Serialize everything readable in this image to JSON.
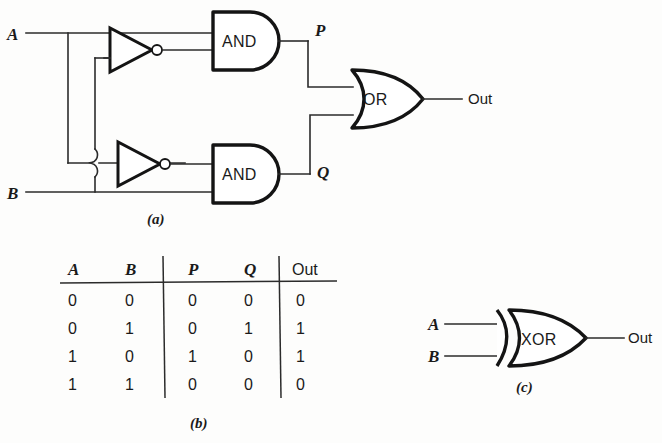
{
  "figure": {
    "captions": {
      "a": "(a)",
      "b": "(b)",
      "c": "(c)"
    }
  },
  "circuit": {
    "inputs": [
      {
        "name": "input-a",
        "label": "A"
      },
      {
        "name": "input-b",
        "label": "B"
      }
    ],
    "gates": [
      {
        "name": "inverter-top",
        "label": "",
        "type": "NOT"
      },
      {
        "name": "inverter-bottom",
        "label": "",
        "type": "NOT"
      },
      {
        "name": "and-gate-top",
        "label": "AND",
        "type": "AND"
      },
      {
        "name": "and-gate-bottom",
        "label": "AND",
        "type": "AND"
      },
      {
        "name": "or-gate",
        "label": "OR",
        "type": "OR"
      }
    ],
    "nodes": [
      {
        "name": "node-p",
        "label": "P"
      },
      {
        "name": "node-q",
        "label": "Q"
      }
    ],
    "output": {
      "name": "output-out",
      "label": "Out"
    }
  },
  "truth_table": {
    "headers": [
      "A",
      "B",
      "P",
      "Q",
      "Out"
    ],
    "header_styles": [
      "serif-italic",
      "serif-italic",
      "serif-italic",
      "serif-italic",
      "sans"
    ],
    "rows": [
      [
        "0",
        "0",
        "0",
        "0",
        "0"
      ],
      [
        "0",
        "1",
        "0",
        "1",
        "1"
      ],
      [
        "1",
        "0",
        "1",
        "0",
        "1"
      ],
      [
        "1",
        "1",
        "0",
        "0",
        "0"
      ]
    ]
  },
  "xor_symbol": {
    "inputs": [
      {
        "name": "xor-input-a",
        "label": "A"
      },
      {
        "name": "xor-input-b",
        "label": "B"
      }
    ],
    "gate": {
      "name": "xor-gate",
      "label": "XOR"
    },
    "output": {
      "name": "xor-output",
      "label": "Out"
    }
  },
  "colors": {
    "background": "#fdfdfc",
    "ink": "#1a1a1a",
    "wire": "#2b2b2b",
    "gate_outline": "#141414"
  }
}
